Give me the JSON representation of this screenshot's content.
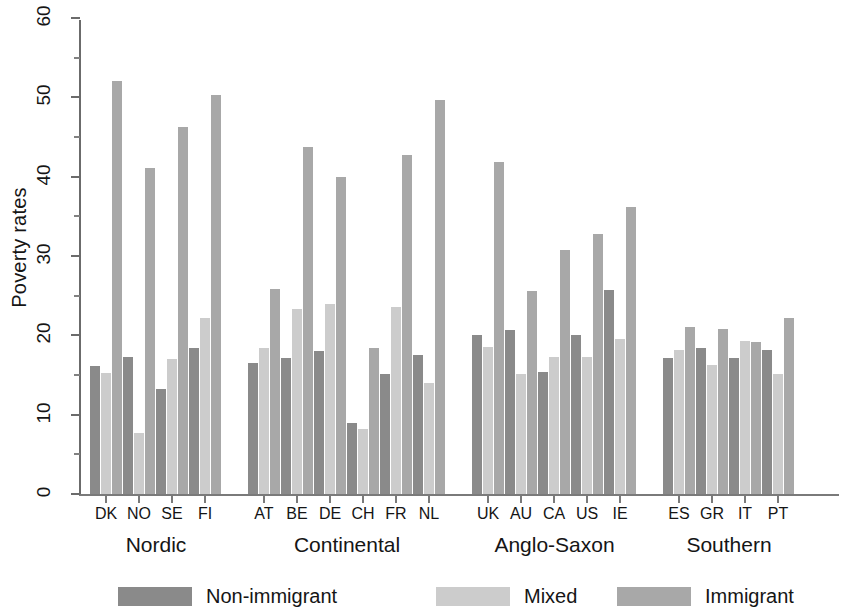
{
  "chart_data": {
    "type": "bar",
    "title": "",
    "xlabel": "",
    "ylabel": "Poverty rates",
    "ylim": [
      0,
      60
    ],
    "yticks": [
      0,
      10,
      20,
      30,
      40,
      50,
      60
    ],
    "yticks_minor": [
      5,
      15,
      25,
      35,
      45,
      55
    ],
    "grid": false,
    "legend_position": "bottom",
    "series": [
      {
        "name": "Non-immigrant",
        "color": "#8a8a8a",
        "values": [
          16.1,
          17.3,
          13.3,
          18.4,
          16.5,
          17.1,
          18.0,
          9.0,
          15.1,
          17.5,
          20.1,
          20.7,
          15.4,
          20.1,
          25.7,
          17.1,
          18.4,
          17.1,
          18.1
        ]
      },
      {
        "name": "Mixed",
        "color": "#cccccc",
        "values": [
          15.3,
          7.7,
          17.0,
          22.2,
          18.4,
          23.3,
          23.9,
          8.2,
          23.6,
          14.0,
          18.5,
          15.1,
          17.3,
          17.3,
          19.6,
          18.1,
          16.2,
          19.3,
          15.1
        ]
      },
      {
        "name": "Immigrant",
        "color": "#a8a8a8",
        "values": [
          52.1,
          41.1,
          46.2,
          50.3,
          25.9,
          43.8,
          39.9,
          18.4,
          42.7,
          49.7,
          41.9,
          25.6,
          30.7,
          32.8,
          36.2,
          21.1,
          20.8,
          19.2,
          22.2
        ]
      }
    ],
    "categories": [
      "DK",
      "NO",
      "SE",
      "FI",
      "AT",
      "BE",
      "DE",
      "CH",
      "FR",
      "NL",
      "UK",
      "AU",
      "CA",
      "US",
      "IE",
      "ES",
      "GR",
      "IT",
      "PT"
    ],
    "groups": [
      {
        "label": "Nordic",
        "countries": [
          "DK",
          "NO",
          "SE",
          "FI"
        ]
      },
      {
        "label": "Continental",
        "countries": [
          "AT",
          "BE",
          "DE",
          "CH",
          "FR",
          "NL"
        ]
      },
      {
        "label": "Anglo-Saxon",
        "countries": [
          "UK",
          "AU",
          "CA",
          "US",
          "IE"
        ]
      },
      {
        "label": "Southern",
        "countries": [
          "ES",
          "GR",
          "IT",
          "PT"
        ]
      }
    ]
  },
  "legend": {
    "items": [
      {
        "label": "Non-immigrant",
        "color": "#8a8a8a"
      },
      {
        "label": "Mixed",
        "color": "#cccccc"
      },
      {
        "label": "Immigrant",
        "color": "#a8a8a8"
      }
    ]
  },
  "axis": {
    "y_label": "Poverty rates"
  }
}
